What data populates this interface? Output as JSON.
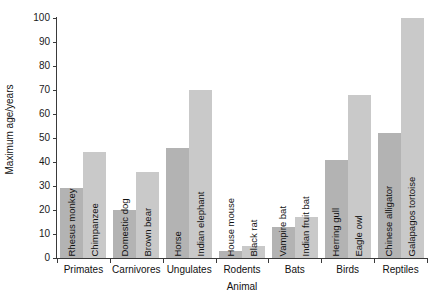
{
  "chart_data": {
    "type": "bar",
    "title": "",
    "xlabel": "Animal",
    "ylabel": "Maximum age/years",
    "ylim": [
      0,
      100
    ],
    "yticks": [
      0,
      10,
      20,
      30,
      40,
      50,
      60,
      70,
      80,
      90,
      100
    ],
    "grid": false,
    "legend": "none",
    "categories": [
      "Primates",
      "Carnivores",
      "Ungulates",
      "Rodents",
      "Bats",
      "Birds",
      "Reptiles"
    ],
    "groups": [
      {
        "category": "Primates",
        "bars": [
          {
            "label": "Rhesus monkey",
            "value": 29,
            "shade": "dark"
          },
          {
            "label": "Chimpanzee",
            "value": 44,
            "shade": "light"
          }
        ]
      },
      {
        "category": "Carnivores",
        "bars": [
          {
            "label": "Domestic dog",
            "value": 20,
            "shade": "dark"
          },
          {
            "label": "Brown bear",
            "value": 36,
            "shade": "light"
          }
        ]
      },
      {
        "category": "Ungulates",
        "bars": [
          {
            "label": "Horse",
            "value": 46,
            "shade": "dark"
          },
          {
            "label": "Indian elephant",
            "value": 70,
            "shade": "light"
          }
        ]
      },
      {
        "category": "Rodents",
        "bars": [
          {
            "label": "House mouse",
            "value": 3,
            "shade": "dark"
          },
          {
            "label": "Black rat",
            "value": 5,
            "shade": "light"
          }
        ]
      },
      {
        "category": "Bats",
        "bars": [
          {
            "label": "Vampire bat",
            "value": 13,
            "shade": "dark"
          },
          {
            "label": "Indian fruit bat",
            "value": 17,
            "shade": "light"
          }
        ]
      },
      {
        "category": "Birds",
        "bars": [
          {
            "label": "Herring gull",
            "value": 41,
            "shade": "dark"
          },
          {
            "label": "Eagle owl",
            "value": 68,
            "shade": "light"
          }
        ]
      },
      {
        "category": "Reptiles",
        "bars": [
          {
            "label": "Chinese alligator",
            "value": 52,
            "shade": "dark"
          },
          {
            "label": "Galapagos tortoise",
            "value": 100,
            "shade": "light"
          }
        ]
      }
    ],
    "colors": {
      "bar_dark": "#b3b3b3",
      "bar_light": "#c9c9c9",
      "axis": "#3a3a3a",
      "text": "#111111",
      "background": "#ffffff"
    }
  }
}
